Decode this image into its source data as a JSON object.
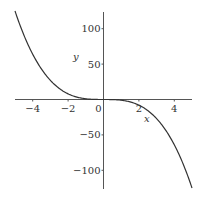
{
  "chart_data": {
    "type": "line",
    "title": "",
    "function": "y = -x^3",
    "xlabel": "x",
    "ylabel": "y",
    "xlim": [
      -5,
      5
    ],
    "ylim": [
      -125,
      125
    ],
    "grid": false,
    "legend": null,
    "x_ticks": [
      -4,
      -2,
      0,
      2,
      4
    ],
    "x_tick_labels": [
      "−4",
      "−2",
      "0",
      "2",
      "4"
    ],
    "y_ticks": [
      100,
      50,
      -50,
      -100
    ],
    "y_tick_labels": [
      "100",
      "50",
      "−50",
      "−100"
    ],
    "series": [
      {
        "name": "y = -x^3",
        "color": "#333333",
        "x": [
          -5,
          -4.5,
          -4,
          -3.5,
          -3,
          -2.5,
          -2,
          -1.5,
          -1,
          -0.5,
          0,
          0.5,
          1,
          1.5,
          2,
          2.5,
          3,
          3.5,
          4,
          4.5,
          5
        ],
        "y": [
          125,
          91.125,
          64,
          42.875,
          27,
          15.625,
          8,
          3.375,
          1,
          0.125,
          0,
          -0.125,
          -1,
          -3.375,
          -8,
          -15.625,
          -27,
          -42.875,
          -64,
          -91.125,
          -125
        ]
      }
    ]
  },
  "colors": {
    "axis": "#555555",
    "curve": "#333333",
    "text": "#333333",
    "background": "#ffffff"
  }
}
